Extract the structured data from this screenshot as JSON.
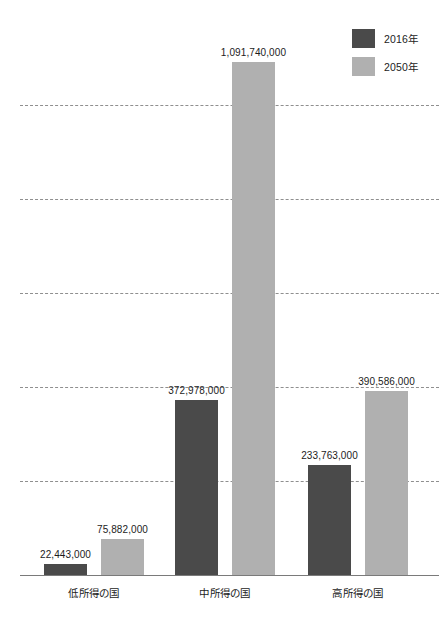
{
  "chart_data": {
    "type": "bar",
    "title": "",
    "subtitle": "",
    "xlabel": "",
    "ylabel": "",
    "grid": true,
    "legend_position": "top-right",
    "ylim": [
      0,
      1200000000
    ],
    "gridline_values": [
      1000000000,
      800000000,
      600000000,
      400000000,
      200000000
    ],
    "axis_tick_labels": [],
    "categories": [
      "低所得の国",
      "中所得の国",
      "高所得の国"
    ],
    "series": [
      {
        "name": "2016年",
        "color": "#4a4a4a",
        "values": [
          22443000,
          372978000,
          233763000
        ],
        "value_labels": [
          "22,443,000",
          "372,978,000",
          "233,763,000"
        ]
      },
      {
        "name": "2050年",
        "color": "#b0b0b0",
        "values": [
          75882000,
          1091740000,
          390586000
        ],
        "value_labels": [
          "75,882,000",
          "1,091,740,000",
          "390,586,000"
        ]
      }
    ]
  },
  "legend": {
    "items": [
      {
        "label": "2016年",
        "color": "#4a4a4a"
      },
      {
        "label": "2050年",
        "color": "#b0b0b0"
      }
    ]
  },
  "colors": {
    "series_2016": "#4a4a4a",
    "series_2050": "#b0b0b0",
    "gridline": "#8f8f8f",
    "baseline": "#7a7a7a",
    "text": "#1c1c1c",
    "background": "#ffffff"
  }
}
